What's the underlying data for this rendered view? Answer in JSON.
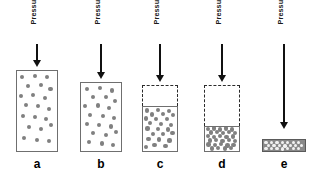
{
  "figure": {
    "caption_repeated": "Pressure",
    "particle_color": "#808080",
    "compressed_particle_color": "#f2f2f2",
    "solid_border_color": "#6f6f6f",
    "dashed_border_color": "#2b2b2b",
    "arrow_color": "#111111",
    "compressed_fill_color": "#8a8a8a"
  },
  "stages": [
    {
      "letter": "a",
      "pressure_label": "Pressure",
      "center_x": 37,
      "arrow_top": 44,
      "arrow_shaft_height": 16,
      "label_bottom_y": 40,
      "vessel_width": 42,
      "vessel_top": 70,
      "vessel_height": 82,
      "void_height": 0,
      "gas_height": 82,
      "compressed": false,
      "particles": [
        {
          "x": 13,
          "y": 7,
          "r": 2.1
        },
        {
          "x": 45,
          "y": 6,
          "r": 2.1
        },
        {
          "x": 76,
          "y": 8,
          "r": 2.1
        },
        {
          "x": 28,
          "y": 19,
          "r": 2.1
        },
        {
          "x": 60,
          "y": 17,
          "r": 2.1
        },
        {
          "x": 84,
          "y": 22,
          "r": 2.1
        },
        {
          "x": 10,
          "y": 31,
          "r": 2.1
        },
        {
          "x": 41,
          "y": 30,
          "r": 2.1
        },
        {
          "x": 69,
          "y": 34,
          "r": 2.1
        },
        {
          "x": 22,
          "y": 43,
          "r": 2.1
        },
        {
          "x": 53,
          "y": 44,
          "r": 2.1
        },
        {
          "x": 81,
          "y": 47,
          "r": 2.1
        },
        {
          "x": 14,
          "y": 56,
          "r": 2.1
        },
        {
          "x": 44,
          "y": 58,
          "r": 2.1
        },
        {
          "x": 72,
          "y": 60,
          "r": 2.1
        },
        {
          "x": 30,
          "y": 70,
          "r": 2.1
        },
        {
          "x": 61,
          "y": 72,
          "r": 2.1
        },
        {
          "x": 86,
          "y": 68,
          "r": 2.1
        },
        {
          "x": 18,
          "y": 84,
          "r": 2.1
        },
        {
          "x": 50,
          "y": 86,
          "r": 2.1
        },
        {
          "x": 79,
          "y": 88,
          "r": 2.1
        }
      ]
    },
    {
      "letter": "b",
      "pressure_label": "Pressure",
      "center_x": 101,
      "arrow_top": 44,
      "arrow_shaft_height": 28,
      "label_bottom_y": 40,
      "vessel_width": 42,
      "vessel_top": 82,
      "vessel_height": 70,
      "void_height": 0,
      "gas_height": 70,
      "compressed": false,
      "particles": [
        {
          "x": 14,
          "y": 9,
          "r": 2.1
        },
        {
          "x": 47,
          "y": 7,
          "r": 2.1
        },
        {
          "x": 78,
          "y": 11,
          "r": 2.1
        },
        {
          "x": 29,
          "y": 21,
          "r": 2.1
        },
        {
          "x": 62,
          "y": 20,
          "r": 2.1
        },
        {
          "x": 86,
          "y": 26,
          "r": 2.1
        },
        {
          "x": 11,
          "y": 34,
          "r": 2.1
        },
        {
          "x": 42,
          "y": 33,
          "r": 2.1
        },
        {
          "x": 70,
          "y": 37,
          "r": 2.1
        },
        {
          "x": 23,
          "y": 47,
          "r": 2.1
        },
        {
          "x": 55,
          "y": 48,
          "r": 2.1
        },
        {
          "x": 83,
          "y": 51,
          "r": 2.1
        },
        {
          "x": 15,
          "y": 60,
          "r": 2.1
        },
        {
          "x": 46,
          "y": 62,
          "r": 2.1
        },
        {
          "x": 74,
          "y": 64,
          "r": 2.1
        },
        {
          "x": 31,
          "y": 74,
          "r": 2.1
        },
        {
          "x": 63,
          "y": 76,
          "r": 2.1
        },
        {
          "x": 88,
          "y": 72,
          "r": 2.1
        },
        {
          "x": 19,
          "y": 87,
          "r": 2.1
        },
        {
          "x": 52,
          "y": 89,
          "r": 2.1
        },
        {
          "x": 80,
          "y": 91,
          "r": 2.1
        }
      ]
    },
    {
      "letter": "c",
      "pressure_label": "Pressure",
      "center_x": 160,
      "arrow_top": 44,
      "arrow_shaft_height": 31,
      "label_bottom_y": 40,
      "vessel_width": 36,
      "vessel_top": 85,
      "vessel_height": 67,
      "void_height": 21,
      "gas_height": 46,
      "compressed": false,
      "particles": [
        {
          "x": 12,
          "y": 8,
          "r": 2.1
        },
        {
          "x": 44,
          "y": 6,
          "r": 2.1
        },
        {
          "x": 76,
          "y": 9,
          "r": 2.1
        },
        {
          "x": 27,
          "y": 17,
          "r": 2.1
        },
        {
          "x": 60,
          "y": 16,
          "r": 2.1
        },
        {
          "x": 88,
          "y": 19,
          "r": 2.1
        },
        {
          "x": 9,
          "y": 26,
          "r": 2.1
        },
        {
          "x": 39,
          "y": 27,
          "r": 2.1
        },
        {
          "x": 70,
          "y": 28,
          "r": 2.1
        },
        {
          "x": 21,
          "y": 37,
          "r": 2.1
        },
        {
          "x": 52,
          "y": 38,
          "r": 2.1
        },
        {
          "x": 82,
          "y": 40,
          "r": 2.1
        },
        {
          "x": 13,
          "y": 49,
          "r": 2.1
        },
        {
          "x": 43,
          "y": 50,
          "r": 2.1
        },
        {
          "x": 73,
          "y": 51,
          "r": 2.1
        },
        {
          "x": 29,
          "y": 61,
          "r": 2.1
        },
        {
          "x": 60,
          "y": 62,
          "r": 2.1
        },
        {
          "x": 87,
          "y": 60,
          "r": 2.1
        },
        {
          "x": 16,
          "y": 73,
          "r": 2.1
        },
        {
          "x": 48,
          "y": 74,
          "r": 2.1
        },
        {
          "x": 78,
          "y": 76,
          "r": 2.1
        },
        {
          "x": 34,
          "y": 87,
          "r": 2.1
        },
        {
          "x": 66,
          "y": 88,
          "r": 2.1
        },
        {
          "x": 10,
          "y": 90,
          "r": 2.1
        }
      ]
    },
    {
      "letter": "d",
      "pressure_label": "Pressure",
      "center_x": 222,
      "arrow_top": 44,
      "arrow_shaft_height": 31,
      "label_bottom_y": 40,
      "vessel_width": 36,
      "vessel_top": 85,
      "vessel_height": 67,
      "void_height": 41,
      "gas_height": 26,
      "compressed": false,
      "particles": [
        {
          "x": 9,
          "y": 9,
          "r": 2.2
        },
        {
          "x": 26,
          "y": 6,
          "r": 2.2
        },
        {
          "x": 44,
          "y": 10,
          "r": 2.2
        },
        {
          "x": 62,
          "y": 7,
          "r": 2.2
        },
        {
          "x": 80,
          "y": 11,
          "r": 2.2
        },
        {
          "x": 17,
          "y": 23,
          "r": 2.2
        },
        {
          "x": 35,
          "y": 21,
          "r": 2.2
        },
        {
          "x": 53,
          "y": 25,
          "r": 2.2
        },
        {
          "x": 71,
          "y": 22,
          "r": 2.2
        },
        {
          "x": 89,
          "y": 26,
          "r": 2.2
        },
        {
          "x": 8,
          "y": 38,
          "r": 2.2
        },
        {
          "x": 27,
          "y": 41,
          "r": 2.2
        },
        {
          "x": 45,
          "y": 37,
          "r": 2.2
        },
        {
          "x": 63,
          "y": 42,
          "r": 2.2
        },
        {
          "x": 82,
          "y": 39,
          "r": 2.2
        },
        {
          "x": 14,
          "y": 56,
          "r": 2.2
        },
        {
          "x": 33,
          "y": 54,
          "r": 2.2
        },
        {
          "x": 51,
          "y": 58,
          "r": 2.2
        },
        {
          "x": 70,
          "y": 55,
          "r": 2.2
        },
        {
          "x": 88,
          "y": 59,
          "r": 2.2
        },
        {
          "x": 10,
          "y": 73,
          "r": 2.2
        },
        {
          "x": 29,
          "y": 76,
          "r": 2.2
        },
        {
          "x": 47,
          "y": 72,
          "r": 2.2
        },
        {
          "x": 66,
          "y": 77,
          "r": 2.2
        },
        {
          "x": 84,
          "y": 74,
          "r": 2.2
        },
        {
          "x": 20,
          "y": 89,
          "r": 2.2
        },
        {
          "x": 39,
          "y": 87,
          "r": 2.2
        },
        {
          "x": 58,
          "y": 90,
          "r": 2.2
        },
        {
          "x": 77,
          "y": 88,
          "r": 2.2
        }
      ]
    },
    {
      "letter": "e",
      "pressure_label": "Pressure",
      "center_x": 284,
      "arrow_top": 44,
      "arrow_shaft_height": 78,
      "label_bottom_y": 40,
      "vessel_width": 44,
      "vessel_top": 139,
      "vessel_height": 13,
      "void_height": 0,
      "gas_height": 13,
      "compressed": true,
      "particles": [
        {
          "x": 7,
          "y": 22,
          "r": 1.7
        },
        {
          "x": 20,
          "y": 20,
          "r": 1.7
        },
        {
          "x": 33,
          "y": 23,
          "r": 1.7
        },
        {
          "x": 46,
          "y": 21,
          "r": 1.7
        },
        {
          "x": 59,
          "y": 24,
          "r": 1.7
        },
        {
          "x": 72,
          "y": 20,
          "r": 1.7
        },
        {
          "x": 85,
          "y": 23,
          "r": 1.7
        },
        {
          "x": 13,
          "y": 50,
          "r": 1.7
        },
        {
          "x": 26,
          "y": 52,
          "r": 1.7
        },
        {
          "x": 39,
          "y": 49,
          "r": 1.7
        },
        {
          "x": 52,
          "y": 53,
          "r": 1.7
        },
        {
          "x": 65,
          "y": 50,
          "r": 1.7
        },
        {
          "x": 78,
          "y": 52,
          "r": 1.7
        },
        {
          "x": 91,
          "y": 49,
          "r": 1.7
        },
        {
          "x": 7,
          "y": 78,
          "r": 1.7
        },
        {
          "x": 20,
          "y": 80,
          "r": 1.7
        },
        {
          "x": 33,
          "y": 77,
          "r": 1.7
        },
        {
          "x": 46,
          "y": 81,
          "r": 1.7
        },
        {
          "x": 59,
          "y": 78,
          "r": 1.7
        },
        {
          "x": 72,
          "y": 80,
          "r": 1.7
        },
        {
          "x": 85,
          "y": 77,
          "r": 1.7
        }
      ]
    }
  ]
}
